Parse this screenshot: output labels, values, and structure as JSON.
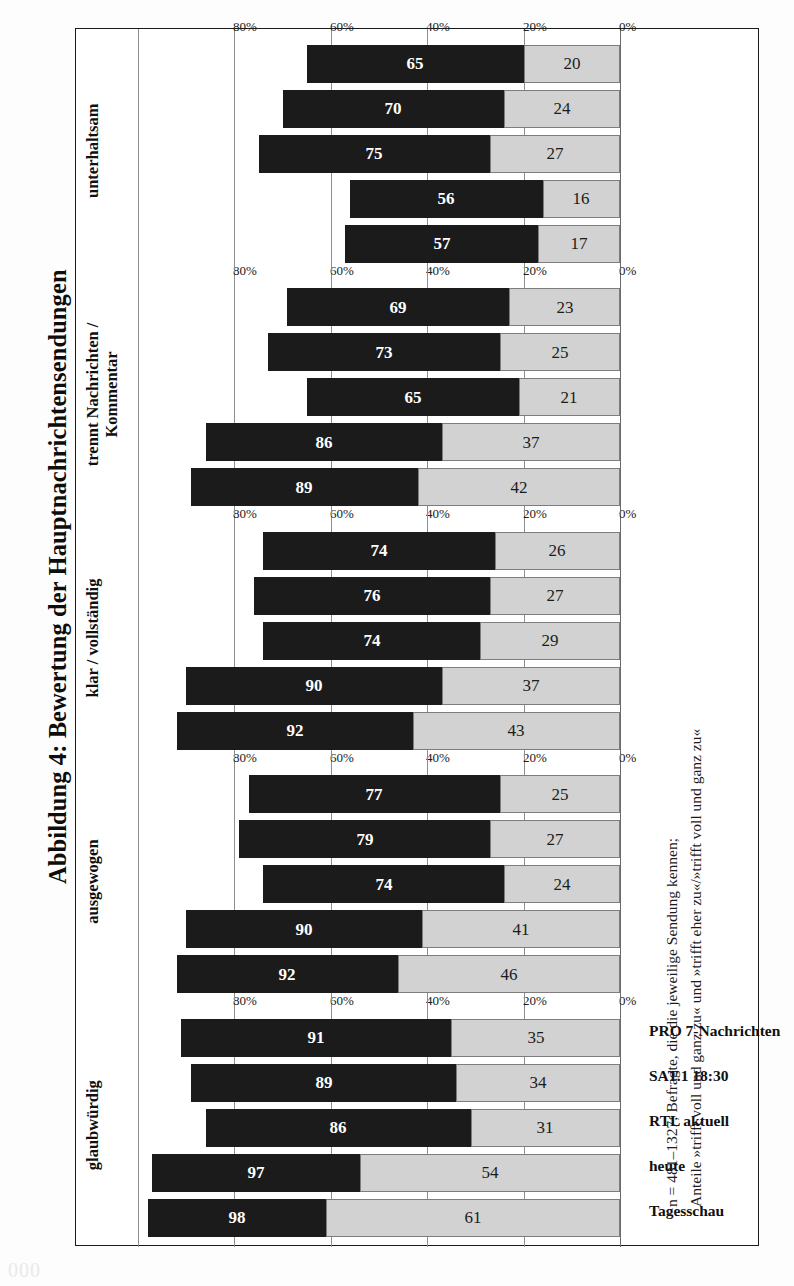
{
  "figure": {
    "title": "Abbildung 4:  Bewertung der Hauptnachrichtensendungen",
    "page_number": "000"
  },
  "footnote": {
    "line1": "n = 481–1327; Befragte, die die jeweilige Sendung kennen;",
    "line2": "Anteile »trifft voll und ganz zu« und »trifft eher zu«/»trifft voll und ganz zu«"
  },
  "colors": {
    "dark_segment": "#1b1b1b",
    "light_segment": "#d2d2d2",
    "gridline": "#8e8e8e",
    "frame": "#1a1a1a"
  },
  "chart_data": {
    "type": "bar",
    "title": "Abbildung 4:  Bewertung der Hauptnachrichtensendungen",
    "xlabel": "",
    "ylabel": "",
    "ylim": [
      0,
      100
    ],
    "grid": true,
    "legend_position": "none",
    "orientation": "rotated-90-ccw stacked column groups",
    "axis_ticks": [
      "0%",
      "20%",
      "40%",
      "60%",
      "80%"
    ],
    "axis_tick_values": [
      0,
      20,
      40,
      60,
      80
    ],
    "categories": [
      "Tagesschau",
      "heute",
      "RTL aktuell",
      "SAT.1 18:30",
      "PRO 7-Nachrichten"
    ],
    "series": [
      {
        "name": "trifft voll und ganz zu",
        "style": "light"
      },
      {
        "name": "trifft eher zu / trifft voll und ganz zu",
        "style": "dark"
      }
    ],
    "panels": [
      {
        "label": "glaubwürdig",
        "label_lines": [
          "glaubwürdig"
        ],
        "light": [
          61,
          54,
          31,
          34,
          35
        ],
        "dark": [
          98,
          97,
          86,
          89,
          91
        ]
      },
      {
        "label": "ausgewogen",
        "label_lines": [
          "ausgewogen"
        ],
        "light": [
          46,
          41,
          24,
          27,
          25
        ],
        "dark": [
          92,
          90,
          74,
          79,
          77
        ]
      },
      {
        "label": "klar / vollständig",
        "label_lines": [
          "klar / vollständig"
        ],
        "light": [
          43,
          37,
          29,
          27,
          26
        ],
        "dark": [
          92,
          90,
          74,
          76,
          74
        ]
      },
      {
        "label": "trennt Nachrichten / Kommentar",
        "label_lines": [
          "trennt Nachrichten /",
          "Kommentar"
        ],
        "light": [
          42,
          37,
          21,
          25,
          23
        ],
        "dark": [
          89,
          86,
          65,
          73,
          69
        ]
      },
      {
        "label": "unterhaltsam",
        "label_lines": [
          "unterhaltsam"
        ],
        "light": [
          17,
          16,
          27,
          24,
          20
        ],
        "dark": [
          57,
          56,
          75,
          70,
          65
        ]
      }
    ]
  }
}
